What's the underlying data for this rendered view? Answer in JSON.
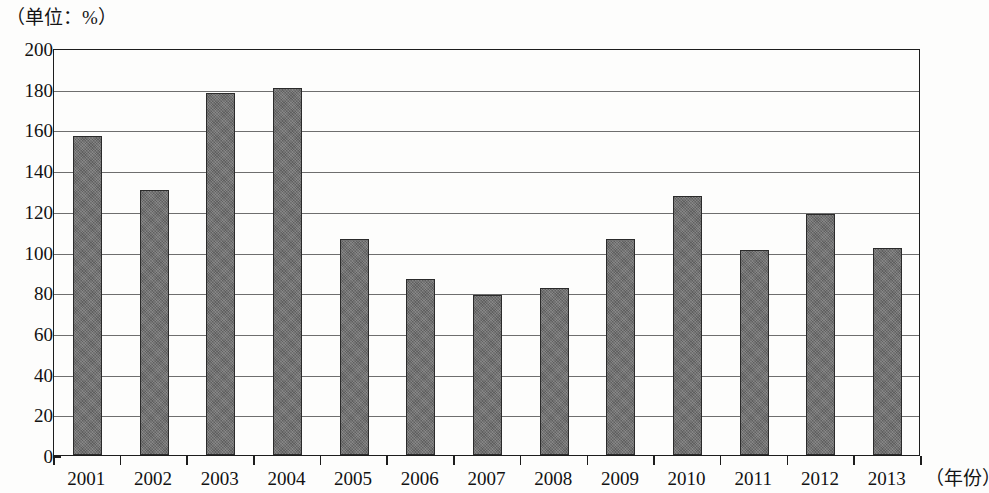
{
  "chart_data": {
    "type": "bar",
    "title": "",
    "unit_caption": "（单位：%）",
    "xlabel": "（年份）",
    "ylabel": "",
    "categories": [
      "2001",
      "2002",
      "2003",
      "2004",
      "2005",
      "2006",
      "2007",
      "2008",
      "2009",
      "2010",
      "2011",
      "2012",
      "2013"
    ],
    "values": [
      157,
      130,
      178,
      180.5,
      106,
      86.5,
      78.5,
      82,
      106,
      127.5,
      100.5,
      118.5,
      101.5
    ],
    "series": [
      {
        "name": "",
        "values": [
          157,
          130,
          178,
          180.5,
          106,
          86.5,
          78.5,
          82,
          106,
          127.5,
          100.5,
          118.5,
          101.5
        ]
      }
    ],
    "ylim": [
      0,
      200
    ],
    "y_ticks": [
      "200",
      "180",
      "160",
      "140",
      "120",
      "100",
      "80",
      "60",
      "40",
      "20",
      "0"
    ],
    "y_tick_values": [
      200,
      180,
      160,
      140,
      120,
      100,
      80,
      60,
      40,
      20,
      0
    ],
    "grid": true,
    "grid_axis": "y",
    "legend": false,
    "legend_position": "none",
    "bar_color": "#6e6e6e",
    "bar_edge_color": "#2b2b2b",
    "plot_border_color": "#1d1d1d",
    "gridline_color": "#6e6e6e",
    "background_color": "#fdfdfc"
  }
}
